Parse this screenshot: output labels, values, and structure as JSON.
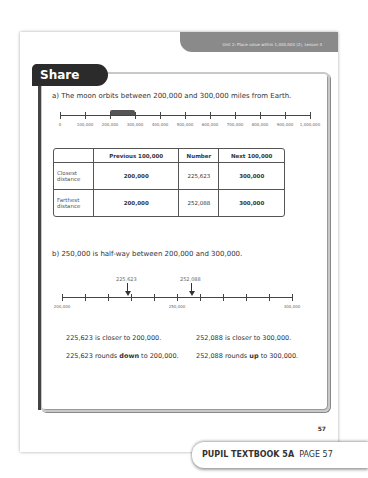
{
  "header": {
    "unit_label": "Unit 2: Place value within 1,000,000 (2), Lesson 4"
  },
  "section": {
    "title": "Share"
  },
  "part_a": {
    "statement": "a)  The moon orbits between 200,000 and 300,000 miles from Earth.",
    "number_line": {
      "ticks": [
        "0",
        "100,000",
        "200,000",
        "300,000",
        "400,000",
        "500,000",
        "600,000",
        "700,000",
        "800,000",
        "900,000",
        "1,000,000"
      ],
      "highlight_from": "200,000",
      "highlight_to": "300,000"
    },
    "table": {
      "headers": [
        "",
        "Previous 100,000",
        "Number",
        "Next 100,000"
      ],
      "rows": [
        {
          "label": "Closest distance",
          "previous": "200,000",
          "number": "225,623",
          "next": "300,000"
        },
        {
          "label": "Farthest distance",
          "previous": "200,000",
          "number": "252,088",
          "next": "300,000"
        }
      ]
    }
  },
  "part_b": {
    "statement": "b)  250,000 is half-way between 200,000 and 300,000.",
    "number_line": {
      "start": "200,000",
      "mid": "250,000",
      "end": "300,000",
      "marker_1": "225,623",
      "marker_2": "252,088"
    },
    "conclusions": {
      "left_1": "225,623 is closer to 200,000.",
      "right_1": "252,088 is closer to 300,000.",
      "left_2_pre": "225,623 rounds ",
      "left_2_bold": "down",
      "left_2_post": " to 200,000.",
      "right_2_pre": "252,088 rounds ",
      "right_2_bold": "up",
      "right_2_post": " to 300,000."
    }
  },
  "footer": {
    "page_number": "57",
    "book_title": "PUPIL TEXTBOOK 5A",
    "page_label": "PAGE 57"
  }
}
